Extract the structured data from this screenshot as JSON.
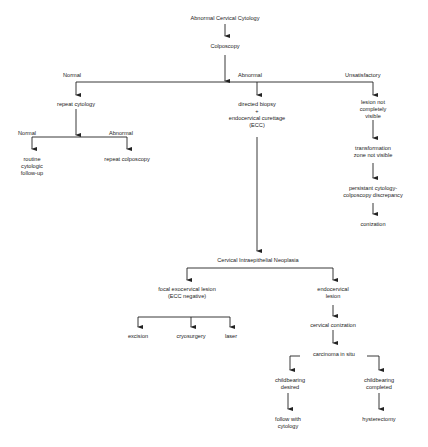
{
  "diagram": {
    "title": "Abnormal Cervical Cytology",
    "nodes": {
      "root": "Abnormal Cervical Cytology",
      "colposcopy": "Colposcopy",
      "repeat_cytology": "repeat cytology",
      "routine_followup": [
        "routine",
        "cytologic",
        "follow-up"
      ],
      "repeat_colposcopy": "repeat colposcopy",
      "biopsy": [
        "directed biopsy",
        "+",
        "endocervical curettage",
        "(ECC)"
      ],
      "lesion_not_visible": [
        "lesion not",
        "completely",
        "visible"
      ],
      "tz_not_visible": [
        "transformation",
        "zone not visible"
      ],
      "discrepancy": [
        "persistant cytology-",
        "colposcopy discrepancy"
      ],
      "conization": "conization",
      "cin": "Cervical Intraepithelial Neoplasia",
      "focal_lesion": [
        "focal exocervical lesion",
        "(ECC negative)"
      ],
      "endocervical_lesion": [
        "endocervical",
        "lesion"
      ],
      "excision": "excision",
      "cryosurgery": "cryosurgery",
      "laser": "laser",
      "cervical_conization": "cervical conization",
      "cis": "carcinoma in situ",
      "childbearing_desired": [
        "childbearing",
        "desired"
      ],
      "childbearing_completed": [
        "childbearing",
        "completed"
      ],
      "follow_cytology": [
        "follow with",
        "cytology"
      ],
      "hysterectomy": "hysterectomy"
    },
    "edge_labels": {
      "normal_1": "Normal",
      "abnormal_1": "Abnormal",
      "unsatisfactory": "Unsatisfactory",
      "normal_2": "Normal",
      "abnormal_2": "Abnormal"
    },
    "colors": {
      "line": "#222222",
      "background": "#ffffff"
    }
  }
}
